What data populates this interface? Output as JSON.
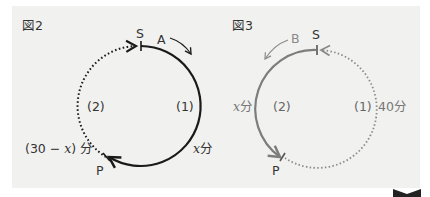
{
  "figures": [
    {
      "title": "図2",
      "start_label": "S",
      "point_label": "P",
      "runner_label": "A",
      "arc1_label": "(1)",
      "arc2_label": "(2)",
      "arc1_time": "x分",
      "arc1_time_var": "x",
      "arc1_time_unit": "分",
      "arc2_time_prefix": "(30 − ",
      "arc2_time_var": "x",
      "arc2_time_suffix": ") 分",
      "direction": "clockwise",
      "solid_color": "#1a1a1a",
      "dotted_color": "#1a1a1a"
    },
    {
      "title": "図3",
      "start_label": "S",
      "point_label": "P",
      "runner_label": "B",
      "arc1_label": "(1)",
      "arc2_label": "(2)",
      "arc1_time": "40分",
      "arc2_time": "x分",
      "arc2_time_var": "x",
      "arc2_time_unit": "分",
      "direction": "counterclockwise",
      "solid_color": "#7d7d7d",
      "dotted_color": "#8a8a8a"
    }
  ],
  "colors": {
    "panel_bg": "#f1f1ef",
    "fig2_ink": "#1a1a1a",
    "fig3_ink": "#7d7d7d",
    "text": "#333333"
  }
}
